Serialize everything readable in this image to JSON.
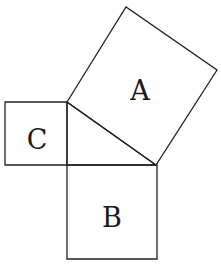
{
  "diagram": {
    "type": "pythagorean-theorem-squares",
    "colors": {
      "stroke": "#222222",
      "text": "#1a1a1a",
      "background": "#ffffff"
    },
    "triangle": {
      "points": "67,102 156,165 67,165"
    },
    "squares": [
      {
        "id": "A",
        "label": "A",
        "points": "67,102 126,7 217,70 156,165",
        "label_x": 140,
        "label_y": 100
      },
      {
        "id": "B",
        "label": "B",
        "points": "67,165 157,165 157,259 67,259",
        "label_x": 112,
        "label_y": 227
      },
      {
        "id": "C",
        "label": "C",
        "points": "5,102 67,102 67,165 5,165",
        "label_x": 37,
        "label_y": 149
      }
    ]
  }
}
